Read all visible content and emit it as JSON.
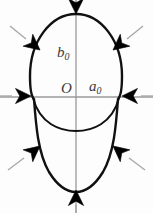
{
  "figure": {
    "name": "ellipsoid-stability-diagram",
    "background_color": "#fdfdfd",
    "width": 153,
    "height": 213,
    "labels": {
      "semi_minor_vertical": {
        "base": "b",
        "subscript": "0",
        "text": "b0"
      },
      "origin": {
        "base": "O",
        "subscript": "",
        "text": "O"
      },
      "semi_major_horizontal": {
        "base": "a",
        "subscript": "0",
        "text": "a0"
      }
    },
    "axes": {
      "color": "#9a9a9a",
      "stroke_width": 1.2,
      "origin_x": 76,
      "origin_y": 97,
      "horizontal_extent": [
        0,
        153
      ],
      "vertical_extent": [
        0,
        213
      ]
    },
    "curves": {
      "outline_color": "#111111",
      "outline_stroke_width": 2.4,
      "outline_description": "closed egg-shaped oval (ellipsoid silhouette)",
      "equator_arc_description": "shallow arc dipping below the horizontal axis (front rim of ellipsoid)",
      "equator_arc_stroke_width": 2.0
    },
    "arrows": {
      "count": 8,
      "head_color": "#000000",
      "tail_color": "#a8a8a8",
      "direction": "inward",
      "items": [
        {
          "name": "arrow-top",
          "angle_deg": 90,
          "points": "down"
        },
        {
          "name": "arrow-top-right",
          "angle_deg": 45,
          "points": "down-left"
        },
        {
          "name": "arrow-right",
          "angle_deg": 0,
          "points": "left"
        },
        {
          "name": "arrow-bottom-right",
          "angle_deg": 315,
          "points": "up-left"
        },
        {
          "name": "arrow-bottom",
          "angle_deg": 270,
          "points": "up"
        },
        {
          "name": "arrow-bottom-left",
          "angle_deg": 225,
          "points": "up-right"
        },
        {
          "name": "arrow-left",
          "angle_deg": 180,
          "points": "right"
        },
        {
          "name": "arrow-top-left",
          "angle_deg": 135,
          "points": "down-right"
        }
      ]
    }
  }
}
